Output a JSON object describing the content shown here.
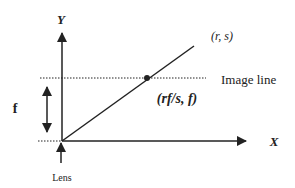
{
  "diagram": {
    "axes": {
      "x_label": "X",
      "y_label": "Y"
    },
    "labels": {
      "point_far": "(r, s)",
      "point_image": "(rf/s, f)",
      "image_line": "Image line",
      "focal_length": "f",
      "lens": "Lens"
    },
    "colors": {
      "stroke": "#222222",
      "background": "#ffffff"
    }
  }
}
